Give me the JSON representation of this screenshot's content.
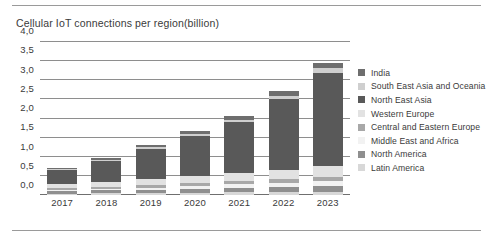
{
  "figure": {
    "title": "Cellular IoT connections per region(billion)"
  },
  "chart_data": {
    "type": "bar",
    "stacked": true,
    "title": "Cellular IoT connections per region(billion)",
    "xlabel": "",
    "ylabel": "",
    "ylim": [
      0,
      4.0
    ],
    "yticks": [
      "0,0",
      "0,5",
      "1,0",
      "1,5",
      "2,0",
      "2,5",
      "3,0",
      "3,5",
      "4,0"
    ],
    "ytick_values": [
      0,
      0.5,
      1.0,
      1.5,
      2.0,
      2.5,
      3.0,
      3.5,
      4.0
    ],
    "grid": true,
    "legend_position": "right",
    "categories": [
      "2017",
      "2018",
      "2019",
      "2020",
      "2021",
      "2022",
      "2023"
    ],
    "series": [
      {
        "name": "Latin America",
        "color": "#d8d8d8",
        "values": [
          0.03,
          0.04,
          0.05,
          0.06,
          0.07,
          0.08,
          0.09
        ]
      },
      {
        "name": "North America",
        "color": "#8f8f8f",
        "values": [
          0.07,
          0.08,
          0.09,
          0.1,
          0.12,
          0.13,
          0.15
        ]
      },
      {
        "name": "Middle East and Africa",
        "color": "#f2f2f2",
        "values": [
          0.03,
          0.04,
          0.05,
          0.07,
          0.09,
          0.11,
          0.13
        ]
      },
      {
        "name": "Central and Eastern Europe",
        "color": "#a8a8a8",
        "values": [
          0.05,
          0.06,
          0.07,
          0.08,
          0.09,
          0.1,
          0.11
        ]
      },
      {
        "name": "Western Europe",
        "color": "#e2e2e2",
        "values": [
          0.1,
          0.12,
          0.15,
          0.18,
          0.21,
          0.24,
          0.27
        ]
      },
      {
        "name": "North East Asia",
        "color": "#595959",
        "values": [
          0.38,
          0.55,
          0.8,
          1.05,
          1.32,
          1.85,
          2.45
        ]
      },
      {
        "name": "South East Asia and Oceania",
        "color": "#cfcfcf",
        "values": [
          0.03,
          0.04,
          0.05,
          0.06,
          0.07,
          0.09,
          0.11
        ]
      },
      {
        "name": "India",
        "color": "#6e6e6e",
        "values": [
          0.03,
          0.04,
          0.05,
          0.07,
          0.09,
          0.11,
          0.14
        ]
      }
    ],
    "totals": [
      0.72,
      0.97,
      1.31,
      1.67,
      2.06,
      2.71,
      3.45
    ]
  },
  "legend": {
    "items": [
      {
        "label": "India",
        "color": "#6e6e6e"
      },
      {
        "label": "South East Asia and Oceania",
        "color": "#cfcfcf"
      },
      {
        "label": "North East Asia",
        "color": "#595959"
      },
      {
        "label": "Western Europe",
        "color": "#e2e2e2"
      },
      {
        "label": "Central and Eastern Europe",
        "color": "#a8a8a8"
      },
      {
        "label": "Middle East and Africa",
        "color": "#f2f2f2"
      },
      {
        "label": "North America",
        "color": "#8f8f8f"
      },
      {
        "label": "Latin America",
        "color": "#d8d8d8"
      }
    ]
  }
}
